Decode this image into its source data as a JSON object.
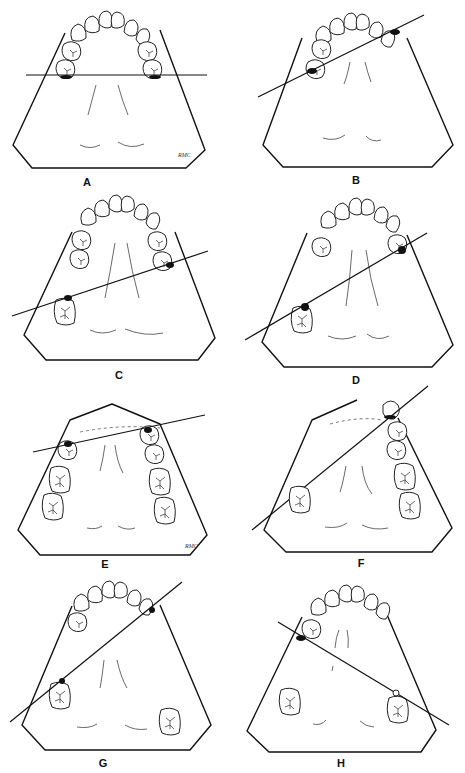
{
  "figure": {
    "panels": [
      {
        "id": "A",
        "label": "A",
        "signature": "RMC"
      },
      {
        "id": "B",
        "label": "B"
      },
      {
        "id": "C",
        "label": "C"
      },
      {
        "id": "D",
        "label": "D"
      },
      {
        "id": "E",
        "label": "E",
        "signature": "RMC"
      },
      {
        "id": "F",
        "label": "F"
      },
      {
        "id": "G",
        "label": "G"
      },
      {
        "id": "H",
        "label": "H"
      }
    ]
  },
  "colors": {
    "line": "#111111",
    "background": "#ffffff"
  }
}
